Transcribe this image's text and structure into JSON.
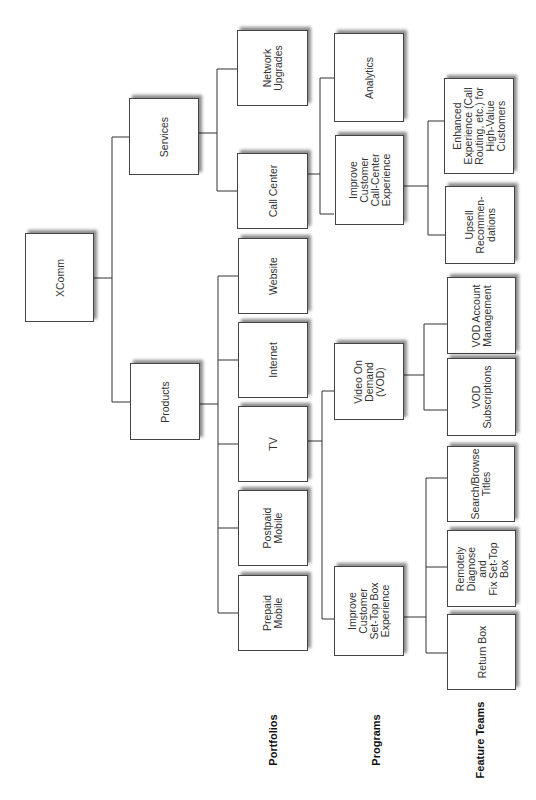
{
  "root": {
    "label": "XComm"
  },
  "level1": [
    {
      "id": "services",
      "label": "Services"
    },
    {
      "id": "products",
      "label": "Products"
    }
  ],
  "portfolios": [
    {
      "id": "network-upgrades",
      "label": "Network\nUpgrades",
      "parent": "services"
    },
    {
      "id": "call-center",
      "label": "Call Center",
      "parent": "services"
    },
    {
      "id": "website",
      "label": "Website",
      "parent": "products"
    },
    {
      "id": "internet",
      "label": "Internet",
      "parent": "products"
    },
    {
      "id": "tv",
      "label": "TV",
      "parent": "products"
    },
    {
      "id": "postpaid-mobile",
      "label": "Postpaid\nMobile",
      "parent": "products"
    },
    {
      "id": "prepaid-mobile",
      "label": "Prepaid\nMobile",
      "parent": "products"
    }
  ],
  "programs": [
    {
      "id": "analytics",
      "label": "Analytics",
      "parent": "call-center"
    },
    {
      "id": "improve-call-center",
      "label": "Improve Customer\nCall-Center\nExperience",
      "parent": "call-center"
    },
    {
      "id": "vod",
      "label": "Video On\nDemand\n(VOD)",
      "parent": "tv"
    },
    {
      "id": "improve-set-top",
      "label": "Improve Customer\nSet-Top Box\nExperience",
      "parent": "tv"
    }
  ],
  "feature_teams": [
    {
      "id": "enhanced-experience",
      "label": "Enhanced\nExperience (Call\nRouting, etc.) for\nHigh-Value\nCustomers",
      "parent": "improve-call-center"
    },
    {
      "id": "upsell",
      "label": "Upsell\nRecommen-\ndations",
      "parent": "improve-call-center"
    },
    {
      "id": "vod-account",
      "label": "VOD Account\nManagement",
      "parent": "vod"
    },
    {
      "id": "vod-subscriptions",
      "label": "VOD\nSubscriptions",
      "parent": "vod"
    },
    {
      "id": "search-browse",
      "label": "Search/Browse\nTitles",
      "parent": "improve-set-top"
    },
    {
      "id": "remotely-diagnose",
      "label": "Remotely\nDiagnose\nand\nFix Set-Top\nBox",
      "parent": "improve-set-top"
    },
    {
      "id": "return-box",
      "label": "Return Box",
      "parent": "improve-set-top"
    }
  ],
  "level_labels": {
    "portfolios": "Portfolios",
    "programs": "Programs",
    "feature_teams": "Feature Teams"
  }
}
